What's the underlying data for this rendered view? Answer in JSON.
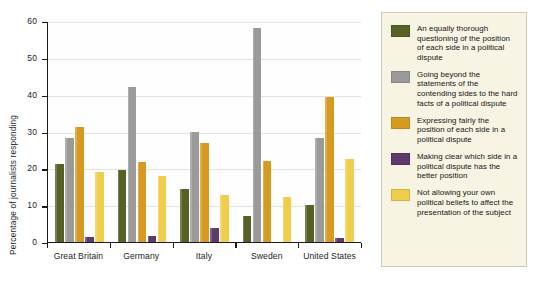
{
  "chart_data": {
    "type": "bar",
    "title": "",
    "subtitle": "",
    "xlabel": "",
    "ylabel": "Percentage of journalists responding",
    "ylim": [
      0,
      60
    ],
    "yticks": [
      0,
      10,
      20,
      30,
      40,
      50,
      60
    ],
    "ytick_labels": [
      "0",
      "10",
      "20",
      "30",
      "40",
      "50",
      "60"
    ],
    "grid": true,
    "legend_position": "right",
    "categories": [
      "Great Britain",
      "Germany",
      "Italy",
      "Sweden",
      "United States"
    ],
    "series": [
      {
        "name": "An equally thorough questioning of the position of each side in a political dispute",
        "color": "#556127",
        "values": [
          21.3,
          19.6,
          14.3,
          7.0,
          10.0
        ]
      },
      {
        "name": "Going beyond the statements of the contending sides to the hard facts of a political dispute",
        "color": "#9a9a9a",
        "values": [
          28.2,
          42.2,
          30.0,
          58.0,
          28.2
        ]
      },
      {
        "name": "Expressing fairly the position of each side in a political dispute",
        "color": "#d79a21",
        "values": [
          31.2,
          21.6,
          26.8,
          22.0,
          39.4
        ]
      },
      {
        "name": "Making clear which side in a political dispute has the better position",
        "color": "#5d3a6b",
        "values": [
          1.3,
          1.6,
          3.8,
          0.0,
          1.0
        ]
      },
      {
        "name": "Not allowing your own political beliefs to affect the presentation of the subject",
        "color": "#f0cd4b",
        "values": [
          19.0,
          17.8,
          12.8,
          12.3,
          22.6
        ]
      }
    ]
  },
  "legend": {
    "items": [
      {
        "label": "An equally thorough questioning of the position of each side in a political dispute",
        "color": "#556127",
        "swatch_name": "legend-swatch-dark-olive"
      },
      {
        "label": "Going beyond the statements of the contending sides to the hard facts of a political dispute",
        "color": "#9a9a9a",
        "swatch_name": "legend-swatch-gray"
      },
      {
        "label": "Expressing fairly the position of each side in a political dispute",
        "color": "#d79a21",
        "swatch_name": "legend-swatch-gold"
      },
      {
        "label": "Making clear which side in a political dispute has the better position",
        "color": "#5d3a6b",
        "swatch_name": "legend-swatch-purple"
      },
      {
        "label": "Not allowing your own political beliefs to affect the presentation of the subject",
        "color": "#f0cd4b",
        "swatch_name": "legend-swatch-pale-yellow"
      }
    ]
  }
}
